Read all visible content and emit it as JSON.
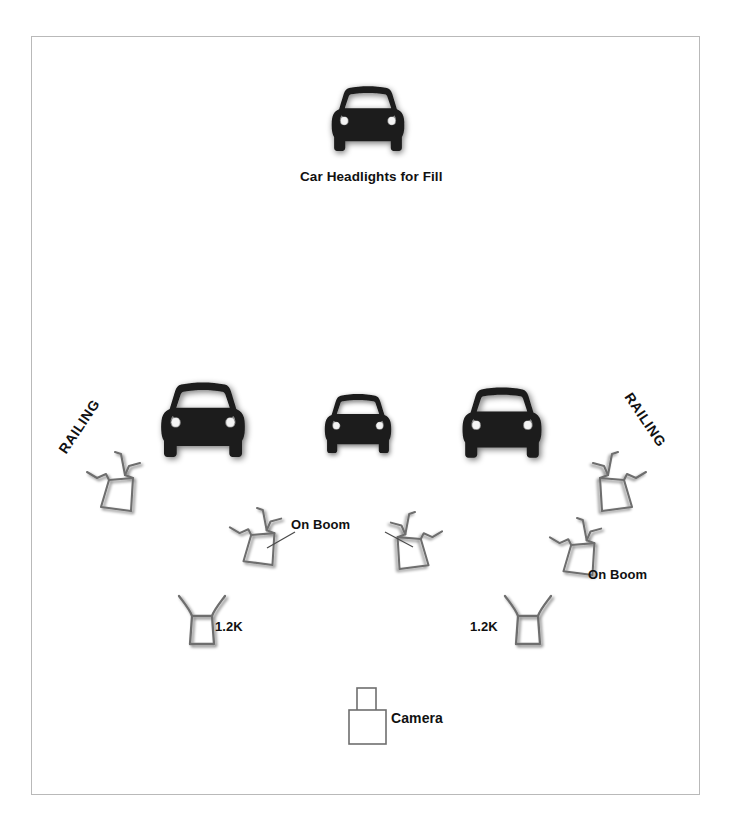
{
  "diagram": {
    "background_color": "#ffffff",
    "frame_color": "#b9b9b9",
    "ink_color": "#111111",
    "fixture_stroke_color": "#6e6e6e",
    "car_color": "#1a1a1a"
  },
  "labels": {
    "fill_car": "Car Headlights for Fill",
    "railing_left": "RAILING",
    "railing_right": "RAILING",
    "on_boom_center": "On Boom",
    "on_boom_right": "On Boom",
    "one_two_k_left": "1.2K",
    "one_two_k_right": "1.2K",
    "camera": "Camera"
  },
  "elements": {
    "cars": [
      {
        "name": "fill-car",
        "role": "Car Headlights for Fill",
        "x": 322,
        "y": 72,
        "w": 92,
        "h": 92
      },
      {
        "name": "hero-car-left",
        "role": "subject car left",
        "x": 150,
        "y": 366,
        "w": 106,
        "h": 100
      },
      {
        "name": "hero-car-center",
        "role": "subject car center",
        "x": 316,
        "y": 381,
        "w": 84,
        "h": 80
      },
      {
        "name": "hero-car-right",
        "role": "subject car right",
        "x": 452,
        "y": 372,
        "w": 100,
        "h": 94
      }
    ],
    "lights": [
      {
        "name": "light-railing-left",
        "type": "railing fixture",
        "x": 85,
        "y": 450,
        "w": 60,
        "h": 62,
        "mirrored": false
      },
      {
        "name": "light-railing-right",
        "type": "railing fixture",
        "x": 588,
        "y": 450,
        "w": 60,
        "h": 62,
        "mirrored": true
      },
      {
        "name": "light-boom-left",
        "type": "boom fixture",
        "x": 228,
        "y": 508,
        "w": 56,
        "h": 58,
        "mirrored": false
      },
      {
        "name": "light-boom-right",
        "type": "boom fixture",
        "x": 386,
        "y": 512,
        "w": 56,
        "h": 58,
        "mirrored": true
      },
      {
        "name": "light-boom-far-right",
        "type": "boom fixture",
        "x": 548,
        "y": 518,
        "w": 56,
        "h": 58,
        "mirrored": false
      },
      {
        "name": "light-1k2-left",
        "type": "1.2K open face",
        "x": 174,
        "y": 592,
        "w": 48,
        "h": 56
      },
      {
        "name": "light-1k2-right",
        "type": "1.2K open face",
        "x": 500,
        "y": 592,
        "w": 48,
        "h": 56
      }
    ],
    "camera": {
      "name": "camera",
      "x": 348,
      "y": 686,
      "w": 40,
      "h": 58
    }
  }
}
